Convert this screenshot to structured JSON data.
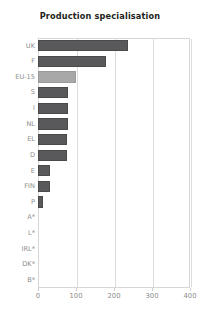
{
  "chart_data": {
    "type": "bar",
    "orientation": "horizontal",
    "title": "Production specialisation",
    "xlabel": "",
    "ylabel": "",
    "xlim": [
      0,
      400
    ],
    "xticks": [
      0,
      100,
      200,
      300,
      400
    ],
    "xtick_labels": [
      "0",
      "100",
      "200",
      "300",
      "400"
    ],
    "grid": true,
    "grid_axis": "x",
    "legend": false,
    "categories": [
      "UK",
      "F",
      "EU-15",
      "S",
      "I",
      "NL",
      "EL",
      "D",
      "E",
      "FIN",
      "P",
      "A*",
      "L*",
      "IRL*",
      "DK*",
      "B*"
    ],
    "values": [
      237,
      180,
      100,
      80,
      78,
      78,
      77,
      76,
      32,
      31,
      13,
      0,
      0,
      0,
      0,
      0
    ],
    "bars": [
      {
        "category": "UK",
        "value": 237,
        "color": "#59595b",
        "highlight": false
      },
      {
        "category": "F",
        "value": 180,
        "color": "#59595b",
        "highlight": false
      },
      {
        "category": "EU-15",
        "value": 100,
        "color": "#a8a8a8",
        "highlight": true
      },
      {
        "category": "S",
        "value": 80,
        "color": "#59595b",
        "highlight": false
      },
      {
        "category": "I",
        "value": 78,
        "color": "#59595b",
        "highlight": false
      },
      {
        "category": "NL",
        "value": 78,
        "color": "#59595b",
        "highlight": false
      },
      {
        "category": "EL",
        "value": 77,
        "color": "#59595b",
        "highlight": false
      },
      {
        "category": "D",
        "value": 76,
        "color": "#59595b",
        "highlight": false
      },
      {
        "category": "E",
        "value": 32,
        "color": "#59595b",
        "highlight": false
      },
      {
        "category": "FIN",
        "value": 31,
        "color": "#59595b",
        "highlight": false
      },
      {
        "category": "P",
        "value": 13,
        "color": "#59595b",
        "highlight": false
      },
      {
        "category": "A*",
        "value": 0,
        "color": "#59595b",
        "highlight": false
      },
      {
        "category": "L*",
        "value": 0,
        "color": "#59595b",
        "highlight": false
      },
      {
        "category": "IRL*",
        "value": 0,
        "color": "#59595b",
        "highlight": false
      },
      {
        "category": "DK*",
        "value": 0,
        "color": "#59595b",
        "highlight": false
      },
      {
        "category": "B*",
        "value": 0,
        "color": "#59595b",
        "highlight": false
      }
    ],
    "colors": {
      "bar": "#59595b",
      "bar_highlight": "#a8a8a8",
      "grid": "#dcdcdc",
      "axis_border": "#d6d6d6",
      "tick_label": "#8d8d8d",
      "title": "#231f20",
      "background": "#ffffff"
    }
  }
}
